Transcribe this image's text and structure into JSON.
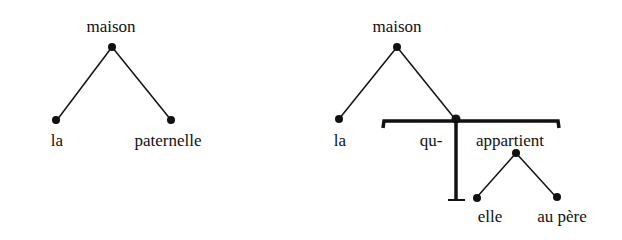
{
  "left_tree": {
    "root": "maison",
    "left_leaf": "la",
    "right_leaf": "paternelle"
  },
  "right_tree": {
    "root": "maison",
    "left_leaf": "la",
    "relative_pronoun": "qu-",
    "verb": "appartient",
    "subject": "elle",
    "object": "au père"
  },
  "colors": {
    "ink": "#111111",
    "background": "#ffffff"
  }
}
